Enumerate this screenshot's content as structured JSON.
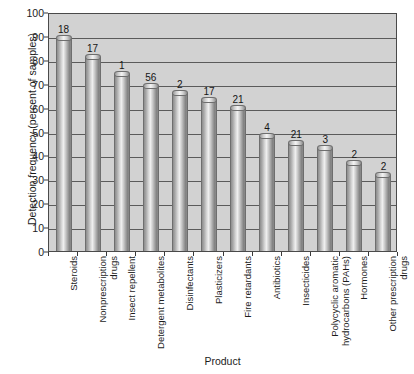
{
  "chart_data": {
    "type": "bar",
    "title": "",
    "xlabel": "Product",
    "ylabel": "Detection frequency (percent of samples)",
    "ylim": [
      0,
      100
    ],
    "ytick_labels": [
      "100",
      "90",
      "80",
      "70",
      "60",
      "50",
      "40",
      "30",
      "20",
      "10",
      "0"
    ],
    "ytick_values": [
      100,
      90,
      80,
      70,
      60,
      50,
      40,
      30,
      20,
      10,
      0
    ],
    "grid": "horizontal",
    "legend": "none",
    "categories": [
      "Steroids",
      "Nonprescription\ndrugs",
      "Insect repellent",
      "Detergent metabolites",
      "Disinfectants",
      "Plasticizers",
      "Fire retardants",
      "Antibiotics",
      "Insecticides",
      "Polycyclic aromatic\nhydrocarbons (PAHs)",
      "Hormones",
      "Other prescription\ndrugs"
    ],
    "values": [
      89,
      81,
      74,
      69,
      66,
      63,
      60,
      48,
      45,
      43,
      37,
      32
    ],
    "bar_annotations": [
      "18",
      "17",
      "1",
      "56",
      "2",
      "17",
      "21",
      "4",
      "21",
      "3",
      "2",
      "2"
    ],
    "annotation_note": "number of compounds measured within each product category"
  },
  "colors": {
    "figure_background": "#ffffff",
    "plot_background": "#d2d2d2",
    "gridline": "#5b5b5b",
    "axis_line": "#4a4a4a",
    "text": "#1c1c1c",
    "bar_light": "#efefef",
    "bar_dark": "#7e7e7e"
  }
}
